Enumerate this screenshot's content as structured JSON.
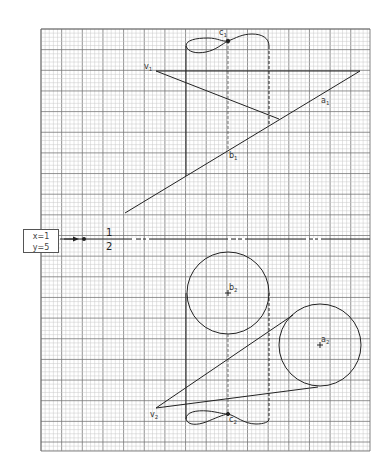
{
  "grid": {
    "left": 41,
    "top": 29,
    "right": 370,
    "bottom": 451,
    "minor_step": 4.13,
    "major_every": 5,
    "minor_color": "#c8c8c8",
    "major_color": "#777777"
  },
  "coord_box": {
    "x_label": "x=1",
    "y_label": "y=5"
  },
  "fold_line": {
    "y": 239,
    "upper_label": "1",
    "lower_label": "2"
  },
  "labels": {
    "v1": "v",
    "v1_sub": "1",
    "a1": "a",
    "a1_sub": "1",
    "b1": "b",
    "b1_sub": "1",
    "c1": "c",
    "c1_sub": "1",
    "v2": "v",
    "v2_sub": "2",
    "a2": "a",
    "a2_sub": "2",
    "b2": "b",
    "b2_sub": "2",
    "c2": "c",
    "c2_sub": "2"
  },
  "geometry": {
    "cylinder_left_x": 186,
    "cylinder_right_x": 269,
    "cylinder_axis_x": 228,
    "circle_b2": {
      "cx": 228,
      "cy": 293,
      "r": 41
    },
    "circle_a2": {
      "cx": 320,
      "cy": 345,
      "r": 41
    },
    "v1": [
      156,
      71
    ],
    "v2": [
      156,
      408
    ],
    "line_a1b1": [
      [
        125,
        213
      ],
      [
        360,
        71
      ]
    ]
  }
}
